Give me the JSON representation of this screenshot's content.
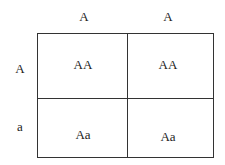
{
  "punnett_square": {
    "column_alleles": [
      "A",
      "A"
    ],
    "row_alleles": [
      "A",
      "a"
    ],
    "cells": [
      [
        "AA",
        "AA"
      ],
      [
        "Aa",
        "Aa"
      ]
    ]
  }
}
